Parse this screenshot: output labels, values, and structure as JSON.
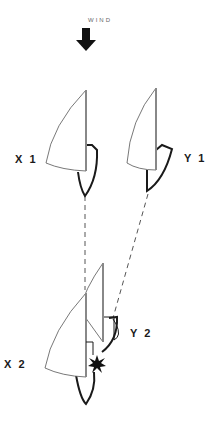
{
  "wind": {
    "label": "WIND",
    "icon": "down-arrow-icon"
  },
  "boats": [
    {
      "id": "X1",
      "label": "X 1",
      "position": "first",
      "side": "left"
    },
    {
      "id": "Y1",
      "label": "Y 1",
      "position": "first",
      "side": "right"
    },
    {
      "id": "X2",
      "label": "X 2",
      "position": "second",
      "side": "left"
    },
    {
      "id": "Y2",
      "label": "Y 2",
      "position": "second",
      "side": "right"
    }
  ],
  "annotations": {
    "collision_icon": "star-burst-icon",
    "track_lines": "dashed"
  },
  "colors": {
    "stroke": "#1a1a1a",
    "mast": "#888888",
    "sail": "#555555"
  }
}
